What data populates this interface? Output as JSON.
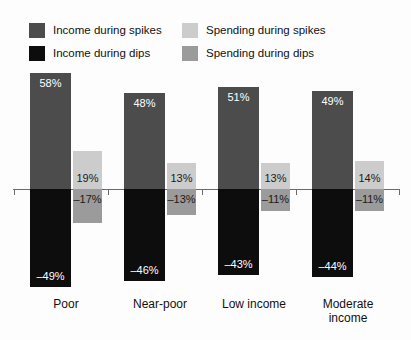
{
  "chart_data": {
    "type": "bar",
    "title": "",
    "subtitle": "",
    "xlabel": "",
    "ylabel": "",
    "grid": false,
    "legend_position": "top",
    "orientation": "vertical-grouped-overlay",
    "zero_line": 0,
    "ylim": [
      -60,
      65
    ],
    "value_suffix": "%",
    "categories": [
      "Poor",
      "Near-poor",
      "Low income",
      "Moderate income"
    ],
    "series": [
      {
        "name": "Income during spikes",
        "color": "#4c4c4c",
        "label_color": "#ffffff",
        "values": [
          58,
          48,
          51,
          49
        ],
        "value_labels": [
          "58%",
          "48%",
          "51%",
          "49%"
        ]
      },
      {
        "name": "Income during dips",
        "color": "#0d0d0d",
        "label_color": "#ffffff",
        "values": [
          -49,
          -46,
          -43,
          -44
        ],
        "value_labels": [
          "–49%",
          "–46%",
          "–43%",
          "–44%"
        ]
      },
      {
        "name": "Spending during spikes",
        "color": "#cccccc",
        "label_color": "#1a1a1a",
        "values": [
          19,
          13,
          13,
          14
        ],
        "value_labels": [
          "19%",
          "13%",
          "13%",
          "14%"
        ]
      },
      {
        "name": "Spending during dips",
        "color": "#9b9b9b",
        "label_color": "#1a1a1a",
        "values": [
          -17,
          -13,
          -11,
          -11
        ],
        "value_labels": [
          "–17%",
          "–13%",
          "–11%",
          "–11%"
        ]
      }
    ]
  },
  "legend": {
    "items": [
      {
        "label": "Income during spikes",
        "color": "#4c4c4c"
      },
      {
        "label": "Income during dips",
        "color": "#0d0d0d"
      },
      {
        "label": "Spending during spikes",
        "color": "#cccccc"
      },
      {
        "label": "Spending during dips",
        "color": "#9b9b9b"
      }
    ]
  },
  "axis": {
    "zero_label": "",
    "line_color": "#6b6b6b"
  },
  "categories_display": [
    {
      "line1": "Poor",
      "line2": ""
    },
    {
      "line1": "Near-poor",
      "line2": ""
    },
    {
      "line1": "Low income",
      "line2": ""
    },
    {
      "line1": "Moderate",
      "line2": "income"
    }
  ]
}
